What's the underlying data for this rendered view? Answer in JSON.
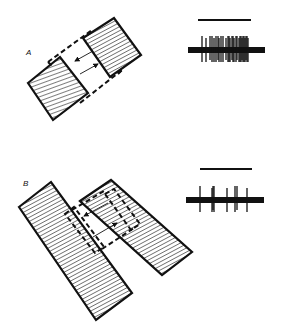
{
  "figure": {
    "background": "#ffffff",
    "ink": "#111111",
    "panels": [
      {
        "id": "A",
        "label": "A",
        "label_pos": [
          26,
          55
        ],
        "description": "Two hatched bars, offset, with dashed receptive-field outline and bidirectional motion arrows",
        "bars": [
          {
            "name": "lower-left-bar",
            "points": "28,83 60,57 88,93 53,120",
            "hatch": "shallow"
          },
          {
            "name": "upper-right-bar",
            "points": "83,38 114,18 141,55 110,77",
            "hatch": "steep"
          }
        ],
        "dashed_outline": [
          {
            "name": "top-dash",
            "points": "48,62 92,30"
          },
          {
            "name": "bottom-dash",
            "points": "80,103 122,70"
          },
          {
            "name": "left-tick",
            "points": "48,62 52,66"
          },
          {
            "name": "right-tick",
            "points": "118,74 122,70"
          }
        ],
        "arrows": [
          {
            "name": "arrow-left",
            "from": [
              93,
              51
            ],
            "to": [
              75,
              61
            ]
          },
          {
            "name": "arrow-right",
            "from": [
              80,
              74
            ],
            "to": [
              98,
              64
            ]
          }
        ],
        "response": {
          "stimulus_bar": {
            "x1": 198,
            "x2": 251,
            "y": 20
          },
          "baseline": {
            "x1": 188,
            "x2": 265,
            "y": 50,
            "thickness": 6
          },
          "spike_region": [
            200,
            249
          ],
          "spikes": [
            202,
            206,
            210,
            212,
            214,
            216,
            218,
            219,
            221,
            223,
            226,
            228,
            229,
            230,
            232,
            233,
            234,
            236,
            237,
            239,
            240,
            241,
            242,
            243,
            244,
            245,
            246,
            247,
            248
          ],
          "spike_top": 36,
          "spike_bottom": 62
        }
      },
      {
        "id": "B",
        "label": "B",
        "label_pos": [
          23,
          186
        ],
        "description": "Two long hatched slabs with dashed rectangular outline and bidirectional motion arrows",
        "bars": [
          {
            "name": "left-slab",
            "points": "19,207 51,182 132,293 96,320",
            "hatch": "steep"
          },
          {
            "name": "right-slab",
            "points": "80,201 111,180 192,252 162,275",
            "hatch": "steep"
          }
        ],
        "dashed_outline": [
          {
            "name": "inner-left-rect",
            "points": "65,214 74,207 104,247 95,253"
          },
          {
            "name": "inner-right-rect",
            "points": "105,194 114,189 140,224 131,230"
          },
          {
            "name": "top-dash",
            "points": "72,210 104,191"
          },
          {
            "name": "bottom-dash",
            "points": "102,249 134,228"
          }
        ],
        "arrows": [
          {
            "name": "arrow-left",
            "from": [
              108,
              203
            ],
            "to": [
              84,
              216
            ]
          },
          {
            "name": "arrow-right",
            "from": [
              93,
              237
            ],
            "to": [
              117,
              223
            ]
          }
        ],
        "response": {
          "stimulus_bar": {
            "x1": 200,
            "x2": 252,
            "y": 169
          },
          "baseline": {
            "x1": 186,
            "x2": 264,
            "y": 200,
            "thickness": 6
          },
          "spikes": [
            200,
            212,
            213,
            214,
            227,
            235,
            237,
            247
          ],
          "spike_top": 186,
          "spike_bottom": 212
        }
      }
    ]
  }
}
